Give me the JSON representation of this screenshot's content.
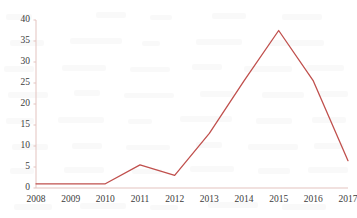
{
  "chart_data": {
    "type": "line",
    "title": "",
    "subtitle": "",
    "xlabel": "",
    "ylabel": "",
    "categories": [
      "2008",
      "2009",
      "2010",
      "2011",
      "2012",
      "2013",
      "2014",
      "2015",
      "2016",
      "2017"
    ],
    "values": [
      1,
      1,
      1,
      5.5,
      3,
      13,
      25.5,
      37.5,
      25.5,
      6.5
    ],
    "series": [
      {
        "name": "",
        "values": [
          1,
          1,
          1,
          5.5,
          3,
          13,
          25.5,
          37.5,
          25.5,
          6.5
        ],
        "color": "#c0504d"
      }
    ],
    "ylim": [
      0,
      40
    ],
    "yticks": [
      0,
      5,
      10,
      15,
      20,
      25,
      30,
      35,
      40
    ],
    "ytick_labels": [
      "0",
      "5",
      "10",
      "15",
      "20",
      "25",
      "30",
      "35",
      "40"
    ],
    "xtick_labels": [
      "2008",
      "2009",
      "2010",
      "2011",
      "2012",
      "2013",
      "2014",
      "2015",
      "2016",
      "2017"
    ],
    "grid": false,
    "legend": false,
    "legend_position": "none",
    "markers": false,
    "annotations": []
  },
  "style": {
    "line_color": "#c0504d",
    "axis_color": "#e3c3bf",
    "tick_text_color": "#3c3c3c",
    "background": "#ffffff",
    "line_width": 1.3
  },
  "geometry": {
    "plot_left": 36,
    "plot_right": 348,
    "plot_top": 20,
    "plot_bottom": 188
  }
}
